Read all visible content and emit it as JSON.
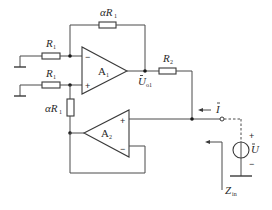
{
  "diagram": {
    "type": "circuit-schematic",
    "colors": {
      "line": "#4a4a4a",
      "background": "#ffffff"
    },
    "components": {
      "r1_top": {
        "label": "R",
        "subscript": "1"
      },
      "r1_bottom": {
        "label": "R",
        "subscript": "1"
      },
      "feedback_top": {
        "label": "αR",
        "subscript": "1"
      },
      "feedback_bottom": {
        "label": "αR",
        "subscript": "1"
      },
      "r2": {
        "label": "R",
        "subscript": "2"
      },
      "opamp_a1": {
        "label": "A",
        "subscript": "1",
        "inverting": "−",
        "noninverting": "+"
      },
      "opamp_a2": {
        "label": "A",
        "subscript": "2",
        "inverting": "−",
        "noninverting": "+"
      },
      "output_node": {
        "label": "U",
        "subscript": "o1"
      },
      "current": {
        "label": "I"
      },
      "source": {
        "label": "U",
        "plus": "+",
        "minus": "−"
      },
      "impedance": {
        "label": "Z",
        "subscript": "in"
      }
    }
  }
}
